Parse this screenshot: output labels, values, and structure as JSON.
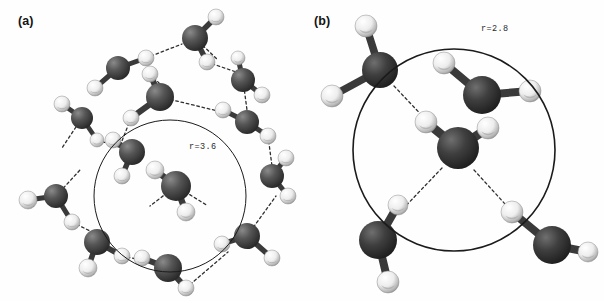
{
  "figure": {
    "type": "molecular-structure-illustration",
    "background_color": "#fefefe",
    "oxygen_color": "#4b4b4b",
    "oxygen_dark": "#2b2b2b",
    "hydrogen_color": "#f2f2f2",
    "hydrogen_shade": "#9a9a9a",
    "bond_color": "#3a3a3a",
    "hbond_color": "#2e2e2e",
    "circle_color": "#1b1b1b"
  },
  "panels": [
    {
      "id": "a",
      "label": "(a)",
      "radius_label": "r=3.6",
      "radius_value": 3.6,
      "circle": {
        "cx": 170,
        "cy": 196,
        "r": 76,
        "stroke_width": 1.0
      },
      "label_pos": {
        "x": 18,
        "y": 14
      },
      "radius_label_pos": {
        "x": 189,
        "y": 142
      },
      "molecule_count": 17,
      "molecules": [
        {
          "ox": 195,
          "oy": 38,
          "or": 13,
          "h": [
            [
              216,
              17,
              8
            ],
            [
              207,
              62,
              8
            ]
          ]
        },
        {
          "ox": 118,
          "oy": 68,
          "or": 12,
          "h": [
            [
              146,
              58,
              8
            ],
            [
              95,
              88,
              8
            ]
          ]
        },
        {
          "ox": 243,
          "oy": 80,
          "or": 12,
          "h": [
            [
              238,
              58,
              7
            ],
            [
              262,
              95,
              8
            ]
          ]
        },
        {
          "ox": 160,
          "oy": 97,
          "or": 14,
          "h": [
            [
              150,
              74,
              8
            ],
            [
              131,
              118,
              8
            ]
          ]
        },
        {
          "ox": 247,
          "oy": 122,
          "or": 12,
          "h": [
            [
              223,
              110,
              8
            ],
            [
              268,
              136,
              8
            ]
          ]
        },
        {
          "ox": 82,
          "oy": 118,
          "or": 11,
          "h": [
            [
              62,
              104,
              8
            ],
            [
              97,
              140,
              7
            ]
          ]
        },
        {
          "ox": 132,
          "oy": 152,
          "or": 13,
          "h": [
            [
              113,
              140,
              8
            ],
            [
              122,
              176,
              8
            ]
          ]
        },
        {
          "ox": 176,
          "oy": 186,
          "or": 15,
          "h": [
            [
              155,
              170,
              9
            ],
            [
              186,
              212,
              9
            ]
          ]
        },
        {
          "ox": 56,
          "oy": 196,
          "or": 12,
          "h": [
            [
              28,
              200,
              9
            ],
            [
              72,
              222,
              8
            ]
          ]
        },
        {
          "ox": 272,
          "oy": 176,
          "or": 12,
          "h": [
            [
              286,
              158,
              8
            ],
            [
              288,
              196,
              8
            ]
          ]
        },
        {
          "ox": 97,
          "oy": 242,
          "or": 13,
          "h": [
            [
              88,
              268,
              9
            ],
            [
              122,
              256,
              8
            ]
          ]
        },
        {
          "ox": 168,
          "oy": 268,
          "or": 14,
          "h": [
            [
              142,
              258,
              8
            ],
            [
              186,
              288,
              8
            ]
          ]
        },
        {
          "ox": 247,
          "oy": 236,
          "or": 13,
          "h": [
            [
              222,
              244,
              8
            ],
            [
              272,
              258,
              8
            ]
          ]
        },
        {
          "ox": 209,
          "oy": 46,
          "or": 0,
          "h": []
        },
        {
          "ox": 268,
          "oy": 60,
          "or": 0,
          "h": []
        },
        {
          "ox": 36,
          "oy": 148,
          "or": 0,
          "h": []
        },
        {
          "ox": 215,
          "oy": 118,
          "or": 0,
          "h": []
        }
      ],
      "hbonds": [
        [
          146,
          58,
          182,
          44
        ],
        [
          207,
          62,
          242,
          74
        ],
        [
          150,
          74,
          160,
          84
        ],
        [
          160,
          97,
          222,
          112
        ],
        [
          131,
          118,
          120,
          146
        ],
        [
          97,
          140,
          128,
          150
        ],
        [
          176,
          186,
          155,
          170
        ],
        [
          176,
          186,
          150,
          206
        ],
        [
          176,
          186,
          208,
          206
        ],
        [
          82,
          118,
          62,
          148
        ],
        [
          56,
          196,
          80,
          170
        ],
        [
          72,
          222,
          96,
          234
        ],
        [
          122,
          256,
          160,
          264
        ],
        [
          186,
          288,
          228,
          252
        ],
        [
          247,
          236,
          276,
          196
        ],
        [
          268,
          136,
          272,
          166
        ],
        [
          243,
          80,
          247,
          110
        ],
        [
          195,
          38,
          218,
          60
        ]
      ]
    },
    {
      "id": "b",
      "label": "(b)",
      "radius_label": "r=2.8",
      "radius_value": 2.8,
      "circle": {
        "cx": 454,
        "cy": 150,
        "r": 101,
        "stroke_width": 1.6
      },
      "label_pos": {
        "x": 314,
        "y": 14
      },
      "radius_label_pos": {
        "x": 481,
        "y": 24
      },
      "molecule_count": 5,
      "molecules": [
        {
          "ox": 380,
          "oy": 70,
          "or": 18,
          "h": [
            [
              366,
              26,
              11
            ],
            [
              332,
              96,
              11
            ]
          ]
        },
        {
          "ox": 482,
          "oy": 95,
          "or": 19,
          "h": [
            [
              444,
              63,
              11
            ],
            [
              530,
              91,
              11
            ]
          ]
        },
        {
          "ox": 458,
          "oy": 148,
          "or": 21,
          "h": [
            [
              426,
              122,
              11
            ],
            [
              488,
              128,
              11
            ]
          ]
        },
        {
          "ox": 378,
          "oy": 240,
          "or": 19,
          "h": [
            [
              398,
              205,
              10
            ],
            [
              388,
              282,
              11
            ]
          ]
        },
        {
          "ox": 552,
          "oy": 245,
          "or": 19,
          "h": [
            [
              512,
              212,
              11
            ],
            [
              588,
              252,
              10
            ]
          ]
        }
      ],
      "hbonds": [
        [
          394,
          86,
          430,
          124
        ],
        [
          442,
          168,
          398,
          214
        ],
        [
          474,
          170,
          516,
          216
        ]
      ]
    }
  ]
}
